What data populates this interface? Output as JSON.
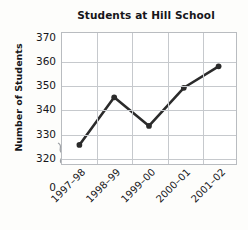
{
  "chart_data": {
    "type": "line",
    "title": "Students at Hill School",
    "xlabel": "",
    "ylabel": "Number of Students",
    "categories": [
      "1997–98",
      "1998–99",
      "1999–00",
      "2000–01",
      "2001–02"
    ],
    "values": [
      325,
      345,
      333,
      349,
      358
    ],
    "series": [
      {
        "name": "Students at Hill School",
        "values": [
          325,
          345,
          333,
          349,
          358
        ]
      }
    ],
    "ytick_labels": [
      "370",
      "360",
      "350",
      "340",
      "330",
      "320",
      "0"
    ],
    "ytick_values": [
      370,
      360,
      350,
      340,
      330,
      320,
      0
    ],
    "ylim": [
      317,
      372
    ],
    "grid": true,
    "legend": "none",
    "axis_break": true,
    "axis_break_between": [
      320,
      0
    ],
    "marker": "circle",
    "line_color": "#2b2b2b",
    "marker_color": "#2b2b2b",
    "grid_color": "#c6c9cd",
    "frame_color": "#b9bcc0",
    "background_color": "#ffffff"
  }
}
